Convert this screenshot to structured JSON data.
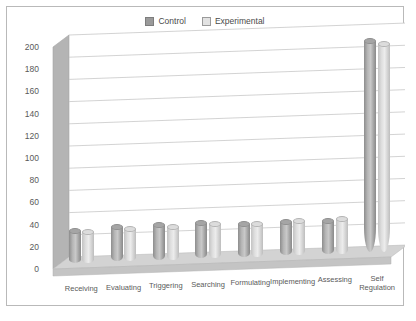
{
  "chart_data": {
    "type": "bar",
    "title": "",
    "xlabel": "",
    "ylabel": "",
    "ylim": [
      0,
      200
    ],
    "ytick_step": 20,
    "yticks": [
      200,
      180,
      160,
      140,
      120,
      100,
      80,
      60,
      40,
      20,
      0
    ],
    "grid": true,
    "legend_position": "top-center",
    "style": "3d-cylinder",
    "categories": [
      "Receiving",
      "Evaluating",
      "Triggering",
      "Searching",
      "Formulating",
      "Implementing",
      "Assessing",
      "Self\nRegulation"
    ],
    "series": [
      {
        "name": "Control",
        "color": "#9a9a9a",
        "values": [
          29,
          31,
          31,
          32,
          30,
          30,
          30,
          190
        ]
      },
      {
        "name": "Experimental",
        "color": "#e2e2e2",
        "values": [
          28,
          29,
          30,
          31,
          30,
          31,
          31,
          188
        ]
      }
    ]
  },
  "legend": {
    "items": [
      {
        "label": "Control",
        "swatch": "filled-square-dark"
      },
      {
        "label": "Experimental",
        "swatch": "outlined-square-light"
      }
    ]
  },
  "colors": {
    "frame_border": "#b9b9b9",
    "plot_background": "#ffffff",
    "gridline": "#c8c8c8",
    "wall": "#b4b4b4",
    "floor": "#d0d0d0",
    "tick_text": "#5a5a5a"
  }
}
